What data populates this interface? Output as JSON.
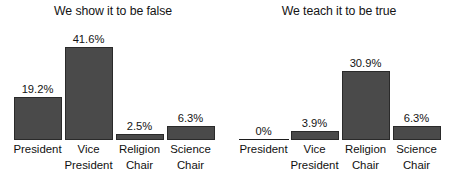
{
  "chart_data": [
    {
      "type": "bar",
      "title": "We show it to be false",
      "xlabel": "",
      "ylabel": "",
      "ylim": [
        0,
        45
      ],
      "grid": false,
      "legend": "none",
      "categories": [
        "President",
        "Vice President",
        "Religion Chair",
        "Science Chair"
      ],
      "category_lines": [
        [
          "President",
          ""
        ],
        [
          "Vice",
          "President"
        ],
        [
          "Religion",
          "Chair"
        ],
        [
          "Science",
          "Chair"
        ]
      ],
      "values": [
        19.2,
        41.6,
        2.5,
        6.3
      ],
      "data_labels": [
        "19.2%",
        "41.6%",
        "2.5%",
        "6.3%"
      ],
      "bar_color": "#4a4a4a"
    },
    {
      "type": "bar",
      "title": "We teach it to be true",
      "xlabel": "",
      "ylabel": "",
      "ylim": [
        0,
        45
      ],
      "grid": false,
      "legend": "none",
      "categories": [
        "President",
        "Vice President",
        "Religion Chair",
        "Science Chair"
      ],
      "category_lines": [
        [
          "President",
          ""
        ],
        [
          "Vice",
          "President"
        ],
        [
          "Religion",
          "Chair"
        ],
        [
          "Science",
          "Chair"
        ]
      ],
      "values": [
        0,
        3.9,
        30.9,
        6.3
      ],
      "data_labels": [
        "0%",
        "3.9%",
        "30.9%",
        "6.3%"
      ],
      "bar_color": "#4a4a4a"
    }
  ]
}
